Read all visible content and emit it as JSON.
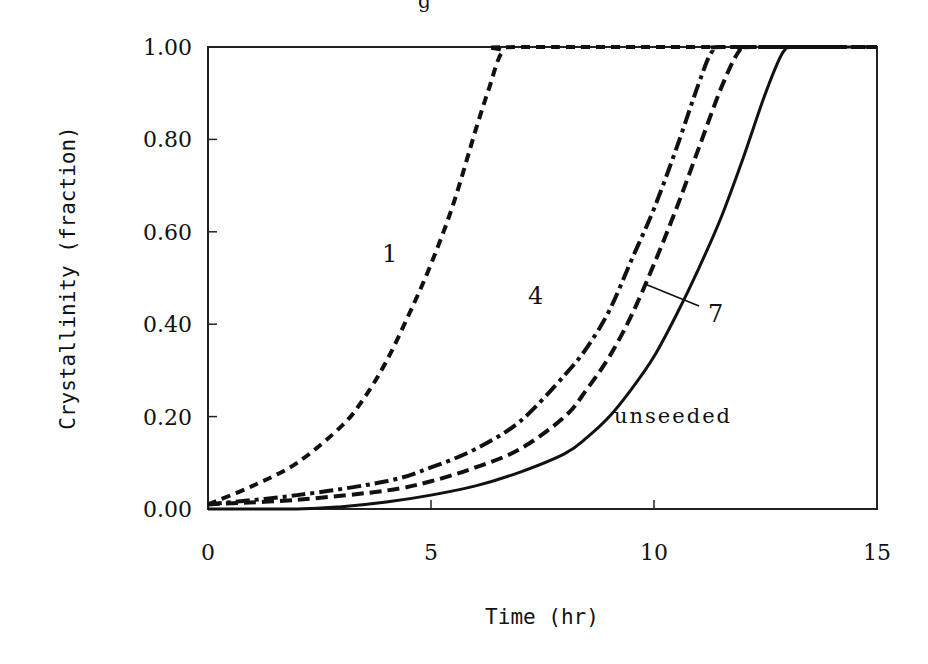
{
  "chart_data": {
    "type": "line",
    "title": "",
    "xlabel": "Time (hr)",
    "ylabel": "Crystallinity (fraction)",
    "xlim": [
      0,
      15
    ],
    "ylim": [
      0,
      1.0
    ],
    "x_ticks": [
      0,
      5,
      10,
      15
    ],
    "x_tick_labels": [
      "0",
      "5",
      "10",
      "15"
    ],
    "y_ticks": [
      0,
      0.2,
      0.4,
      0.6,
      0.8,
      1.0
    ],
    "y_tick_labels": [
      "0.00",
      "0.20",
      "0.40",
      "0.60",
      "0.80",
      "1.00"
    ],
    "grid": false,
    "legend": "none (curves labelled inline)",
    "series": [
      {
        "name": "1",
        "style": "short-dash",
        "x": [
          0,
          1,
          2,
          3,
          3.5,
          4,
          4.5,
          5,
          5.5,
          6,
          6.3,
          6.6,
          7,
          15
        ],
        "values": [
          0.01,
          0.05,
          0.1,
          0.18,
          0.24,
          0.32,
          0.42,
          0.53,
          0.66,
          0.82,
          0.91,
          0.99,
          1.0,
          1.0
        ]
      },
      {
        "name": "4",
        "style": "dash-dot",
        "x": [
          0,
          2,
          4,
          5,
          6,
          7,
          8,
          8.5,
          9,
          9.5,
          10,
          10.5,
          11,
          11.3,
          11.6,
          15
        ],
        "values": [
          0.01,
          0.03,
          0.06,
          0.09,
          0.13,
          0.19,
          0.29,
          0.35,
          0.43,
          0.54,
          0.65,
          0.78,
          0.92,
          0.99,
          1.0,
          1.0
        ]
      },
      {
        "name": "7",
        "style": "dash",
        "x": [
          0,
          2,
          4,
          5,
          6,
          7,
          8,
          8.5,
          9,
          9.5,
          10,
          10.5,
          11,
          11.5,
          11.9,
          12.2,
          15
        ],
        "values": [
          0.01,
          0.02,
          0.04,
          0.06,
          0.09,
          0.13,
          0.2,
          0.26,
          0.33,
          0.42,
          0.53,
          0.65,
          0.78,
          0.91,
          0.99,
          1.0,
          1.0
        ]
      },
      {
        "name": "unseeded",
        "style": "solid",
        "x": [
          0,
          2,
          3,
          4,
          5,
          6,
          7,
          8,
          8.5,
          9,
          9.5,
          10,
          10.5,
          11,
          11.5,
          12,
          12.5,
          12.9,
          13.2,
          15
        ],
        "values": [
          0.0,
          0.0,
          0.005,
          0.015,
          0.03,
          0.05,
          0.08,
          0.12,
          0.155,
          0.2,
          0.26,
          0.33,
          0.42,
          0.52,
          0.63,
          0.76,
          0.9,
          0.99,
          1.0,
          1.0
        ]
      }
    ],
    "annotations": [
      {
        "text": "1",
        "x": 4.0,
        "y": 0.62
      },
      {
        "text": "4",
        "x": 7.3,
        "y": 0.42
      },
      {
        "text": "7",
        "x": 11.5,
        "y": 0.39,
        "leader_to_series": "7"
      },
      {
        "text": "unseeded",
        "x": 10.5,
        "y": 0.21
      }
    ]
  },
  "labels": {
    "xlabel": "Time (hr)",
    "ylabel": "Crystallinity (fraction)",
    "title_fragment": "g",
    "annot_1": "1",
    "annot_4": "4",
    "annot_7": "7",
    "annot_unseeded": "unseeded"
  }
}
